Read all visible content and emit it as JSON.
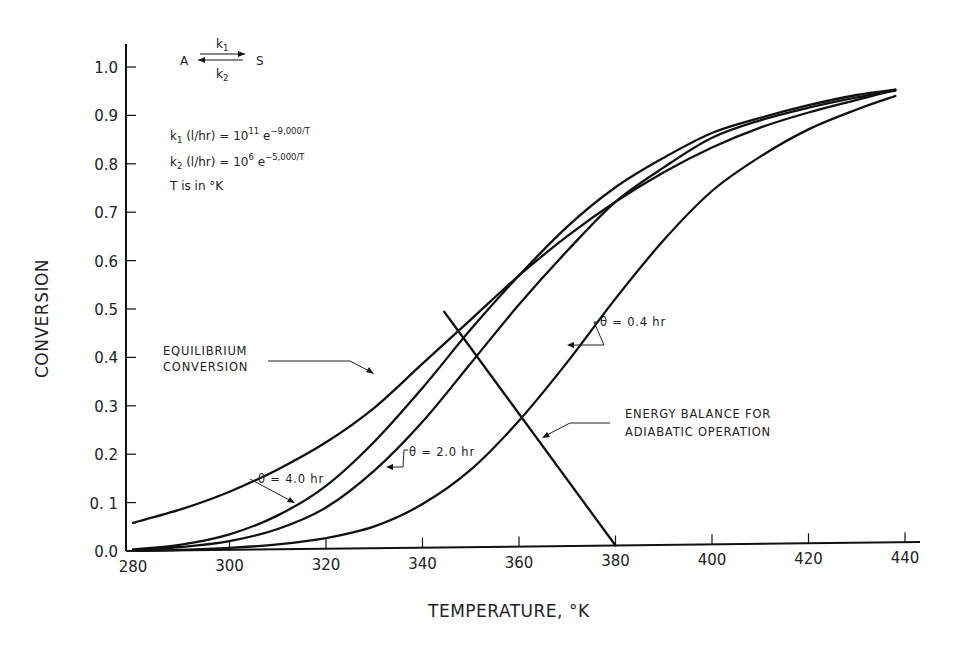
{
  "chart_data": {
    "type": "line",
    "title": "",
    "xlabel": "TEMPERATURE, °K",
    "ylabel": "CONVERSION",
    "xlim": [
      280,
      440
    ],
    "ylim": [
      0.0,
      1.0
    ],
    "grid": false,
    "x_ticks": [
      280,
      300,
      320,
      340,
      360,
      380,
      400,
      420,
      440
    ],
    "x_tick_labels": [
      "280",
      "300",
      "320",
      "340",
      "360",
      "380",
      "400",
      "420",
      "440"
    ],
    "y_ticks": [
      0.0,
      0.1,
      0.2,
      0.3,
      0.4,
      0.5,
      0.6,
      0.7,
      0.8,
      0.9,
      1.0
    ],
    "y_tick_labels": [
      "0.0",
      "0. 1",
      "0.2",
      "0.3",
      "0.4",
      "0.5",
      "0.6",
      "0.7",
      "0.8",
      "0.9",
      "1.0"
    ],
    "x": [
      280,
      290,
      300,
      310,
      320,
      330,
      340,
      350,
      360,
      370,
      380,
      390,
      400,
      410,
      420,
      430,
      438
    ],
    "series": [
      {
        "name": "EQUILIBRIUM CONVERSION",
        "values": [
          0.058,
          0.085,
          0.12,
          0.165,
          0.22,
          0.29,
          0.38,
          0.47,
          0.56,
          0.64,
          0.71,
          0.77,
          0.82,
          0.86,
          0.89,
          0.915,
          0.935
        ]
      },
      {
        "name": "θ = 4.0 hr",
        "values": [
          0.003,
          0.012,
          0.032,
          0.07,
          0.13,
          0.22,
          0.33,
          0.45,
          0.56,
          0.66,
          0.74,
          0.8,
          0.85,
          0.88,
          0.905,
          0.925,
          0.935
        ]
      },
      {
        "name": "θ = 2.0 hr",
        "values": [
          0.002,
          0.007,
          0.018,
          0.042,
          0.085,
          0.16,
          0.26,
          0.38,
          0.5,
          0.61,
          0.71,
          0.78,
          0.84,
          0.875,
          0.9,
          0.92,
          0.933
        ]
      },
      {
        "name": "θ = 0.4 hr",
        "values": [
          0.0,
          0.001,
          0.004,
          0.01,
          0.022,
          0.045,
          0.09,
          0.16,
          0.26,
          0.38,
          0.51,
          0.63,
          0.73,
          0.8,
          0.855,
          0.895,
          0.922
        ]
      },
      {
        "name": "ENERGY BALANCE FOR ADIABATIC OPERATION",
        "x": [
          344.5,
          380
        ],
        "values": [
          0.487,
          0.0
        ]
      }
    ],
    "annotations": [
      {
        "text": "EQUILIBRIUM CONVERSION",
        "target": "equilibrium curve"
      },
      {
        "text": "θ = 4.0 hr"
      },
      {
        "text": "θ = 2.0 hr"
      },
      {
        "text": "θ = 0.4 hr"
      },
      {
        "text": "ENERGY BALANCE FOR ADIABATIC OPERATION"
      }
    ],
    "legend": "none (inline annotations)"
  },
  "reaction": {
    "reactant": "A",
    "product": "S",
    "k_forward": "k",
    "k_forward_sub": "1",
    "k_reverse": "k",
    "k_reverse_sub": "2"
  },
  "equations": {
    "k1_prefix": "k",
    "k1_sub": "1",
    "k1_body": " (l/hr) = 10",
    "k1_exp_base": "11",
    "k1_e": " e",
    "k1_exp": "−9,000/T",
    "k2_prefix": "k",
    "k2_sub": "2",
    "k2_body": " (l/hr) = 10",
    "k2_exp_base": "6",
    "k2_e": " e",
    "k2_exp": "−5,000/T",
    "units_note": "T is  in  °K"
  },
  "labels": {
    "equilibrium_line1": "EQUILIBRIUM",
    "equilibrium_line2": "CONVERSION",
    "theta4": "θ = 4.0 hr",
    "theta2": "θ = 2.0 hr",
    "theta04": "θ = 0.4 hr",
    "energy_line1": "ENERGY  BALANCE  FOR",
    "energy_line2": "ADIABATIC   OPERATION"
  }
}
